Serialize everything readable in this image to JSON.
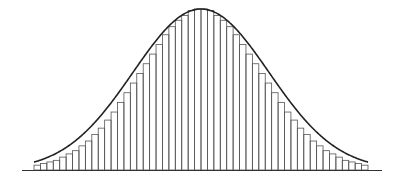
{
  "chart_data": {
    "type": "bar",
    "title": "",
    "subtitle": "",
    "xlabel": "",
    "ylabel": "",
    "bin_count": 52,
    "categories": [
      1,
      2,
      3,
      4,
      5,
      6,
      7,
      8,
      9,
      10,
      11,
      12,
      13,
      14,
      15,
      16,
      17,
      18,
      19,
      20,
      21,
      22,
      23,
      24,
      25,
      26,
      27,
      28,
      29,
      30,
      31,
      32,
      33,
      34,
      35,
      36,
      37,
      38,
      39,
      40,
      41,
      42,
      43,
      44,
      45,
      46,
      47,
      48,
      49,
      50,
      51,
      52
    ],
    "values": [
      0.03,
      0.04,
      0.05,
      0.06,
      0.08,
      0.1,
      0.12,
      0.15,
      0.18,
      0.22,
      0.26,
      0.31,
      0.36,
      0.42,
      0.48,
      0.54,
      0.6,
      0.66,
      0.72,
      0.78,
      0.84,
      0.89,
      0.93,
      0.96,
      0.99,
      1.0,
      1.0,
      0.99,
      0.96,
      0.93,
      0.89,
      0.84,
      0.78,
      0.72,
      0.66,
      0.6,
      0.54,
      0.48,
      0.42,
      0.36,
      0.31,
      0.26,
      0.22,
      0.18,
      0.15,
      0.12,
      0.1,
      0.08,
      0.06,
      0.05,
      0.04,
      0.03
    ],
    "overlay_curve": "normal density",
    "ylim": [
      0,
      1.05
    ],
    "grid": false,
    "legend": null,
    "colors": {
      "bars_stroke": "#555555",
      "curve": "#222222",
      "axis": "#333333",
      "background": "#ffffff"
    }
  }
}
